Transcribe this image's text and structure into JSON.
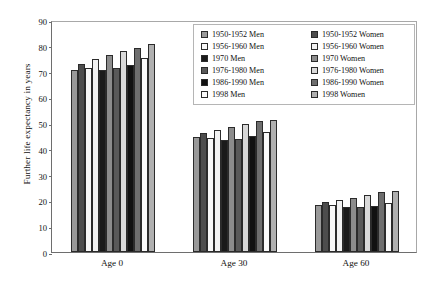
{
  "chart_data": {
    "type": "bar",
    "title": "",
    "subtitle": "",
    "xlabel": "",
    "ylabel": "Further life expectancy in years",
    "ylim": [
      0,
      90
    ],
    "yticks": [
      0,
      10,
      20,
      30,
      40,
      50,
      60,
      70,
      80,
      90
    ],
    "grid": false,
    "legend_position": "top-right",
    "categories": [
      "Age 0",
      "Age 30",
      "Age 60"
    ],
    "series": [
      {
        "name": "1950-1952 Men",
        "color": "#999999",
        "values": [
          70.5,
          44.8,
          18.3
        ]
      },
      {
        "name": "1950-1952 Women",
        "color": "#4d4d4d",
        "values": [
          73.0,
          46.0,
          19.3
        ]
      },
      {
        "name": "1956-1960 Men",
        "color": "#f7f7f7",
        "values": [
          71.5,
          44.4,
          18.3
        ]
      },
      {
        "name": "1956-1960 Women",
        "color": "#f2f2f2",
        "values": [
          74.8,
          47.3,
          20.0
        ]
      },
      {
        "name": "1970 Men",
        "color": "#1a1a1a",
        "values": [
          70.8,
          43.5,
          17.3
        ]
      },
      {
        "name": "1970 Women",
        "color": "#8c8c8c",
        "values": [
          76.3,
          48.5,
          21.0
        ]
      },
      {
        "name": "1976-1980 Men",
        "color": "#595959",
        "values": [
          71.5,
          44.0,
          17.4
        ]
      },
      {
        "name": "1976-1980 Women",
        "color": "#d9d9d9",
        "values": [
          77.8,
          49.8,
          22.3
        ]
      },
      {
        "name": "1986-1990 Men",
        "color": "#111111",
        "values": [
          72.5,
          45.0,
          18.0
        ]
      },
      {
        "name": "1986-1990 Women",
        "color": "#6e6e6e",
        "values": [
          79.2,
          51.0,
          23.3
        ]
      },
      {
        "name": "1998 Men",
        "color": "#fafafa",
        "values": [
          75.3,
          46.5,
          19.0
        ]
      },
      {
        "name": "1998 Women",
        "color": "#b0b0b0",
        "values": [
          80.8,
          51.3,
          23.6
        ]
      }
    ]
  },
  "legend": {
    "entries": [
      "1950-1952 Men",
      "1950-1952 Women",
      "1956-1960 Men",
      "1956-1960 Women",
      "1970 Men",
      "1970 Women",
      "1976-1980 Men",
      "1976-1980 Women",
      "1986-1990 Men",
      "1986-1990 Women",
      "1998 Men",
      "1998 Women"
    ]
  }
}
